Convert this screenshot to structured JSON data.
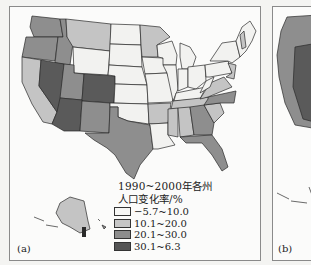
{
  "figure": {
    "panel_a": {
      "label": "(a)",
      "legend": {
        "title_line1": "1990~2000年各州",
        "title_line2": "人口变化率/%",
        "items": [
          {
            "label": "−5.7~10.0",
            "color": "#f7f7f5"
          },
          {
            "label": "10.1~20.0",
            "color": "#c6c6c6"
          },
          {
            "label": "20.1~30.0",
            "color": "#8d8d8d"
          },
          {
            "label": "30.1~6.3",
            "color": "#555555"
          }
        ]
      }
    },
    "panel_b": {
      "label": "(b)"
    }
  },
  "colors": {
    "class1": "#f2f2f0",
    "class2": "#c4c4c4",
    "class3": "#8e8e8e",
    "class4": "#5a5a5a",
    "border": "#2a2a2a",
    "frame": "#8a8a8a"
  }
}
